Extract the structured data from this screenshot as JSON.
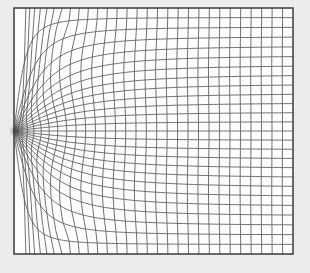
{
  "figure": {
    "canvas": {
      "width": 310,
      "height": 273
    },
    "colors": {
      "page_background": "#ececec",
      "plot_background": "#fdfdfd",
      "grid_line": "#5a5a5a",
      "border_line": "#3a3a3a",
      "sink_smudge": "#3f3f3f"
    },
    "plot_box": {
      "left": 14,
      "top": 8,
      "right": 293,
      "bottom": 254
    },
    "singularity": {
      "x": 14,
      "y": 131
    },
    "mesh": {
      "type": "curvilinear-structured-grid",
      "row_cells": 26,
      "col_cells": 30,
      "far_cell_width": 10.4,
      "far_cell_height": 9.46,
      "fan_half_angle_deg": 90,
      "row_knee_shape": "xi/sqrt(1+xi^2)",
      "col_spacing_min_fraction": 0.28,
      "col_spacing_tau": 0.17,
      "col_spacing_power": 1.2,
      "corner_landing_offset": 9,
      "corner_landing_decay": 60,
      "grid_line_width": 0.85,
      "border_line_width": 1.5,
      "row_solver_samples": 170,
      "sink_smudge_radius": 6.5,
      "sink_smudge_opacity": 0.55
    }
  }
}
